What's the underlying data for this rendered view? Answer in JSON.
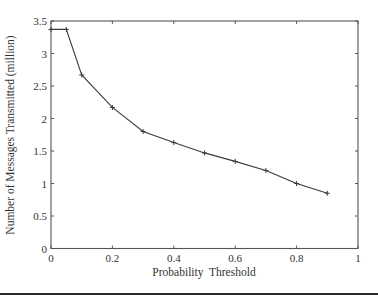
{
  "chart_data": {
    "type": "line",
    "title": "",
    "xlabel": "Probability  Threshold",
    "ylabel": "Number of Messages Transmitted (million)",
    "xlim": [
      0,
      1
    ],
    "ylim": [
      0,
      3.5
    ],
    "xticks": [
      0,
      0.2,
      0.4,
      0.6,
      0.8,
      1
    ],
    "xtick_labels": [
      "0",
      "0.2",
      "0.4",
      "0.6",
      "0.8",
      "1"
    ],
    "yticks": [
      0,
      0.5,
      1,
      1.5,
      2,
      2.5,
      3,
      3.5
    ],
    "ytick_labels": [
      "0",
      "0.5",
      "1",
      "1.5",
      "2",
      "2.5",
      "3",
      "3.5"
    ],
    "grid": false,
    "legend": null,
    "marker": "+",
    "series": [
      {
        "name": "Messages transmitted",
        "x": [
          0,
          0.05,
          0.1,
          0.2,
          0.3,
          0.4,
          0.5,
          0.6,
          0.7,
          0.8,
          0.9
        ],
        "values": [
          3.37,
          3.37,
          2.67,
          2.17,
          1.8,
          1.63,
          1.47,
          1.34,
          1.2,
          1.0,
          0.85
        ]
      }
    ]
  },
  "style": {
    "line_color": "#3a3a3a",
    "axis_color": "#555555",
    "rule_color": "#2a2a2a"
  }
}
